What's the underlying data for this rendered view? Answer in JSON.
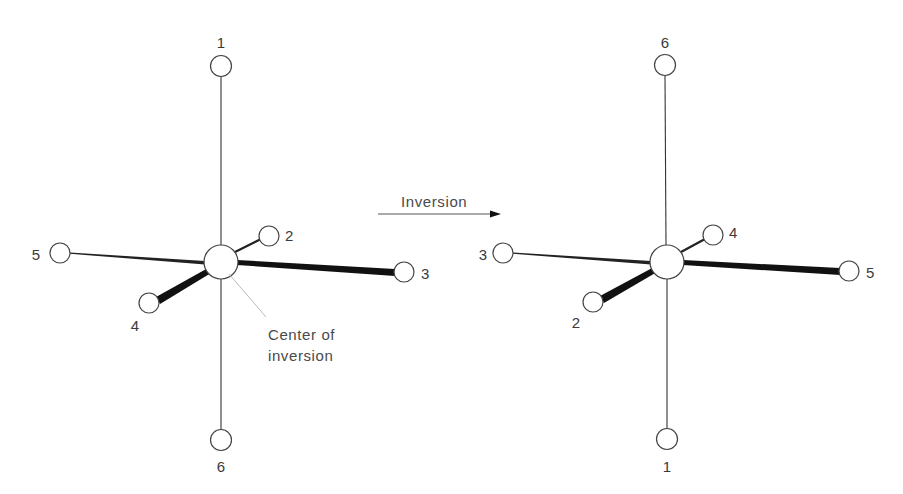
{
  "figure": {
    "arrow_label": "Inversion",
    "annotation": {
      "line1": "Center of",
      "line2": "inversion"
    },
    "colors": {
      "ink": "#333333",
      "background": "#ffffff",
      "leader": "#bbbbbb"
    }
  },
  "before": {
    "title": "Before inversion",
    "labels": {
      "top": "1",
      "upper_right_back": "2",
      "right": "3",
      "lower_left_front": "4",
      "left": "5",
      "bottom": "6"
    }
  },
  "after": {
    "title": "After inversion",
    "labels": {
      "top": "6",
      "upper_right_back": "4",
      "right": "5",
      "lower_left_front": "2",
      "left": "3",
      "bottom": "1"
    }
  }
}
